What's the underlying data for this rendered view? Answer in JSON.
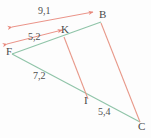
{
  "figure": {
    "background_color": "#fdfdfd",
    "colors": {
      "green_line": "#8fc4a8",
      "red_line": "#e8998a",
      "arrow": "#e8877a",
      "label_text": "#4a4a4a"
    }
  },
  "vertices": [
    {
      "name": "B",
      "label": "B",
      "x": 101,
      "y": 16
    },
    {
      "name": "K",
      "label": "K",
      "x": 63,
      "y": 31
    },
    {
      "name": "F",
      "label": "F",
      "x": 10,
      "y": 52
    },
    {
      "name": "I",
      "label": "I",
      "x": 86,
      "y": 101
    },
    {
      "name": "C",
      "label": "C",
      "x": 140,
      "y": 128
    }
  ],
  "measurements": [
    {
      "name": "FB",
      "label": "9,1",
      "x": 42,
      "y": 12
    },
    {
      "name": "FK",
      "label": "5,2",
      "x": 33,
      "y": 36
    },
    {
      "name": "FI",
      "label": "7,2",
      "x": 38,
      "y": 76
    },
    {
      "name": "IC",
      "label": "5,4",
      "x": 102,
      "y": 112
    }
  ],
  "segments": [
    {
      "name": "F-to-B",
      "color": "green_line"
    },
    {
      "name": "F-to-C",
      "color": "green_line"
    },
    {
      "name": "K-to-I",
      "color": "red_line"
    },
    {
      "name": "B-to-C",
      "color": "red_line"
    }
  ],
  "arrows": [
    {
      "name": "dimension-arrow-FB",
      "label": "9,1",
      "double_headed": true
    },
    {
      "name": "dimension-arrow-FK",
      "label": "5,2",
      "double_headed": true
    }
  ]
}
